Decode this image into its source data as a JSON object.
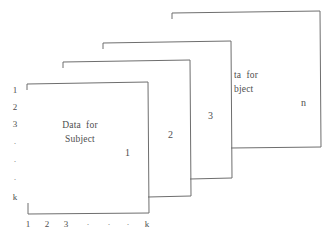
{
  "figure": {
    "title": "",
    "line_color": "#6e6e6e",
    "text_color": "#4e4e4e",
    "background": "#ffffff"
  },
  "row_axis": {
    "name": "row-index-labels",
    "labels": [
      "1",
      "2",
      "3",
      "·",
      "·",
      "·",
      "k"
    ]
  },
  "column_axis": {
    "name": "column-index-labels",
    "labels": [
      "1",
      "2",
      "3",
      "·",
      "·",
      "·",
      "k"
    ]
  },
  "panels": [
    {
      "id": "panel-subject-1",
      "caption_line1": "Data  for",
      "caption_line2": "Subject",
      "number": "1"
    },
    {
      "id": "panel-subject-2",
      "caption_line1": "",
      "caption_line2": "",
      "number": "2"
    },
    {
      "id": "panel-subject-3",
      "caption_line1": "",
      "caption_line2": "",
      "number": "3"
    },
    {
      "id": "panel-subject-n",
      "caption_line1": "ta  for",
      "caption_line2": "bject",
      "number": "n"
    }
  ]
}
